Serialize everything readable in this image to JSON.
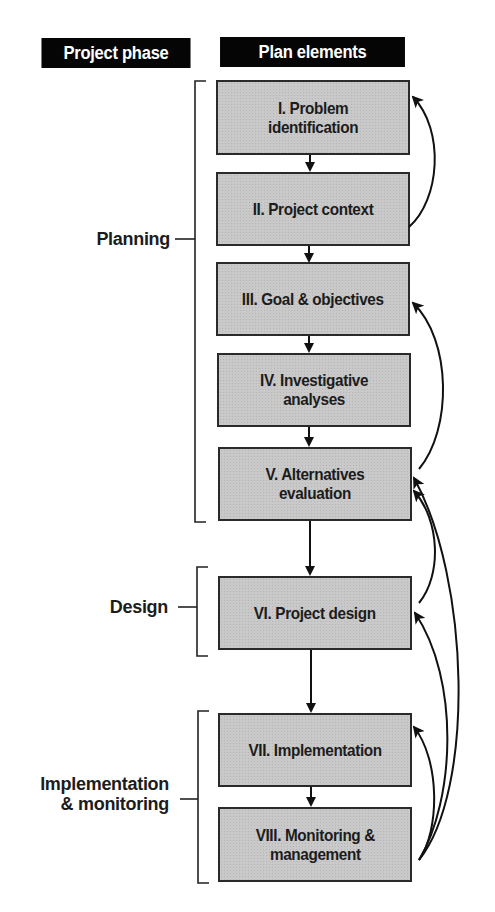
{
  "headers": {
    "phase": "Project phase",
    "elements": "Plan elements"
  },
  "phases": [
    {
      "id": "planning",
      "label": "Planning"
    },
    {
      "id": "design",
      "label": "Design"
    },
    {
      "id": "implementation",
      "label": "Implementation\n& monitoring"
    }
  ],
  "elements": [
    {
      "id": "I",
      "label": "I. Problem\nidentification",
      "phase": "planning"
    },
    {
      "id": "II",
      "label": "II. Project context",
      "phase": "planning"
    },
    {
      "id": "III",
      "label": "III. Goal & objectives",
      "phase": "planning"
    },
    {
      "id": "IV",
      "label": "IV. Investigative\nanalyses",
      "phase": "planning"
    },
    {
      "id": "V",
      "label": "V. Alternatives\nevaluation",
      "phase": "planning"
    },
    {
      "id": "VI",
      "label": "VI. Project design",
      "phase": "design"
    },
    {
      "id": "VII",
      "label": "VII. Implementation",
      "phase": "implementation"
    },
    {
      "id": "VIII",
      "label": "VIII. Monitoring &\nmanagement",
      "phase": "implementation"
    }
  ],
  "flow_edges": [
    [
      "I",
      "II"
    ],
    [
      "II",
      "III"
    ],
    [
      "III",
      "IV"
    ],
    [
      "IV",
      "V"
    ],
    [
      "V",
      "VI"
    ],
    [
      "VI",
      "VII"
    ],
    [
      "VII",
      "VIII"
    ]
  ],
  "feedback_edges": [
    [
      "II",
      "I"
    ],
    [
      "V",
      "III"
    ],
    [
      "VI",
      "V"
    ],
    [
      "VIII",
      "VII"
    ],
    [
      "VIII",
      "VI"
    ],
    [
      "VIII",
      "V"
    ]
  ],
  "colors": {
    "header_bg": "#050505",
    "header_text": "#ffffff",
    "box_fill": "#c9c9c9",
    "line": "#111111"
  }
}
